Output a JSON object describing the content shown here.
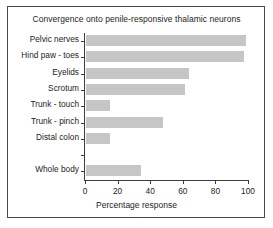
{
  "figure": {
    "background_color": "#ffffff",
    "frame_color": "#4a4a4a",
    "bar_color": "#c6c6c6",
    "axis_color": "#3c3c3c",
    "text_color": "#1d1d1d"
  },
  "chart_data": {
    "type": "bar",
    "orientation": "horizontal",
    "title": "Convergence onto penile-responsive thalamic neurons",
    "xlabel": "Percentage response",
    "ylabel": "",
    "xlim": [
      0,
      100
    ],
    "xticks": [
      0,
      20,
      40,
      60,
      80,
      100
    ],
    "xtick_labels": [
      "0",
      "20",
      "40",
      "60",
      "80",
      "100"
    ],
    "grid": false,
    "legend": false,
    "categories": [
      "Pelvic nerves",
      "Hind paw - toes",
      "Eyelids",
      "Scrotum",
      "Trunk - touch",
      "Trunk - pinch",
      "Distal colon",
      "",
      "Whole body"
    ],
    "values": [
      98,
      97,
      63,
      61,
      15,
      47,
      15,
      null,
      34
    ],
    "bars": [
      {
        "label": "Pelvic nerves",
        "value": 98
      },
      {
        "label": "Hind paw - toes",
        "value": 97
      },
      {
        "label": "Eyelids",
        "value": 63
      },
      {
        "label": "Scrotum",
        "value": 61
      },
      {
        "label": "Trunk - touch",
        "value": 15
      },
      {
        "label": "Trunk - pinch",
        "value": 47
      },
      {
        "label": "Distal colon",
        "value": 15
      },
      {
        "label": "",
        "value": null
      },
      {
        "label": "Whole body",
        "value": 34
      }
    ]
  }
}
